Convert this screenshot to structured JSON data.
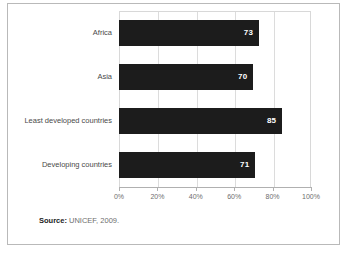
{
  "figure": {
    "source_label": "Source:",
    "source_text": "UNICEF, 2009."
  },
  "chart_data": {
    "type": "bar",
    "orientation": "horizontal",
    "title": "",
    "subtitle": "",
    "xlabel": "",
    "ylabel": "",
    "categories": [
      "Africa",
      "Asia",
      "Least developed countries",
      "Developing countries"
    ],
    "values": [
      73,
      70,
      85,
      71
    ],
    "value_labels": [
      "73",
      "70",
      "85",
      "71"
    ],
    "xlim": [
      0,
      100
    ],
    "xticks": [
      0,
      20,
      40,
      60,
      80,
      100
    ],
    "xtick_labels": [
      "0%",
      "20%",
      "40%",
      "60%",
      "80%",
      "100%"
    ],
    "grid": true,
    "grid_axis": "x",
    "legend": false,
    "bar_color": "#1c1c1c",
    "value_label_color": "#ffffff",
    "axis_text_color": "#6e6e6e",
    "category_text_color": "#4a4a4a",
    "grid_color": "#dcdcdc",
    "background_color": "#ffffff",
    "frame_color": "#b9b9b9"
  }
}
